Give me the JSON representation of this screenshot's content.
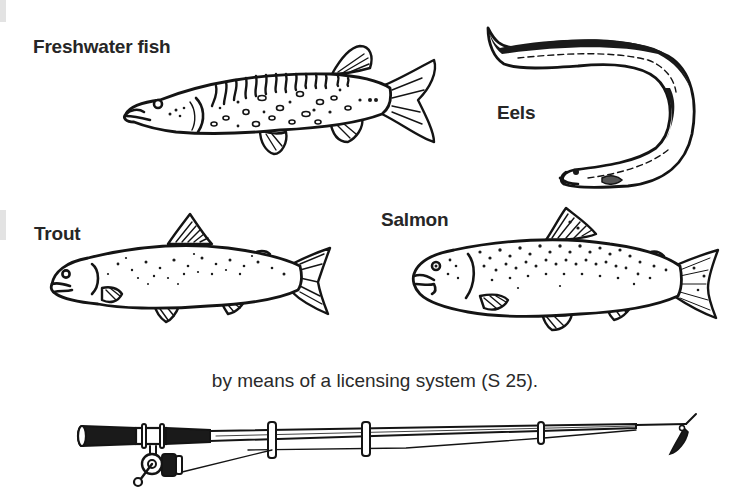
{
  "page": {
    "labels": {
      "freshwater_fish": "Freshwater fish",
      "eels": "Eels",
      "trout": "Trout",
      "salmon": "Salmon"
    },
    "caption": "by means of a licensing system (S 25).",
    "illustrations": [
      {
        "name": "pike-illustration",
        "label": "Freshwater fish"
      },
      {
        "name": "eel-illustration",
        "label": "Eels"
      },
      {
        "name": "trout-illustration",
        "label": "Trout"
      },
      {
        "name": "salmon-illustration",
        "label": "Salmon"
      },
      {
        "name": "fishing-rod-illustration",
        "label": ""
      }
    ],
    "colors": {
      "ink": "#141414",
      "paper": "#ffffff",
      "text": "#262626"
    }
  }
}
